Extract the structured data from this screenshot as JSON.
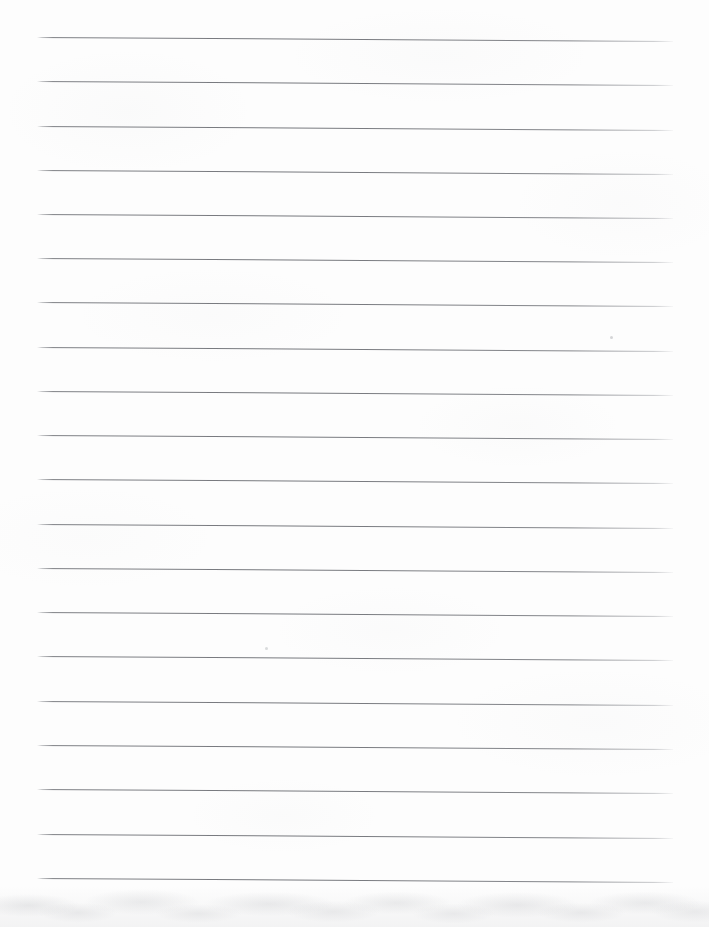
{
  "document": {
    "kind": "lined-notebook-paper",
    "title": "Blank Ruled Paper",
    "width_px": 709,
    "height_px": 927,
    "page_background_color": "#fdfdfd",
    "has_written_content": false,
    "body_text": ""
  },
  "ruling": {
    "line_count": 20,
    "line_color": "#787a7d",
    "line_thickness_px": 1,
    "line_spacing_px": 44.3,
    "first_line_y_px": 37,
    "last_line_y_px": 878,
    "line_start_x_px": 37,
    "line_end_x_px": 673,
    "line_length_px": 636,
    "tilt_deg": 0.35,
    "left_margin_px": 37,
    "right_margin_px": 36,
    "top_margin_px": 37,
    "bottom_margin_px": 49,
    "has_vertical_margin_rule": false,
    "has_holes": false,
    "lines": [
      {
        "index": 1,
        "y_px": 37,
        "content": ""
      },
      {
        "index": 2,
        "y_px": 81,
        "content": ""
      },
      {
        "index": 3,
        "y_px": 126,
        "content": ""
      },
      {
        "index": 4,
        "y_px": 170,
        "content": ""
      },
      {
        "index": 5,
        "y_px": 214,
        "content": ""
      },
      {
        "index": 6,
        "y_px": 258,
        "content": ""
      },
      {
        "index": 7,
        "y_px": 302,
        "content": ""
      },
      {
        "index": 8,
        "y_px": 347,
        "content": ""
      },
      {
        "index": 9,
        "y_px": 391,
        "content": ""
      },
      {
        "index": 10,
        "y_px": 435,
        "content": ""
      },
      {
        "index": 11,
        "y_px": 479,
        "content": ""
      },
      {
        "index": 12,
        "y_px": 524,
        "content": ""
      },
      {
        "index": 13,
        "y_px": 568,
        "content": ""
      },
      {
        "index": 14,
        "y_px": 612,
        "content": ""
      },
      {
        "index": 15,
        "y_px": 656,
        "content": ""
      },
      {
        "index": 16,
        "y_px": 701,
        "content": ""
      },
      {
        "index": 17,
        "y_px": 745,
        "content": ""
      },
      {
        "index": 18,
        "y_px": 789,
        "content": ""
      },
      {
        "index": 19,
        "y_px": 834,
        "content": ""
      },
      {
        "index": 20,
        "y_px": 878,
        "content": ""
      }
    ]
  },
  "marks": [
    {
      "name": "speck-upper-right",
      "x_px": 610,
      "y_px": 336,
      "size_px": 3,
      "color": "#b9bbbe"
    },
    {
      "name": "speck-lower-left",
      "x_px": 265,
      "y_px": 647,
      "size_px": 3,
      "color": "#c2c4c7"
    }
  ],
  "scan_artifacts": {
    "bottom_shadow_band": true,
    "bottom_shadow_height_px": 48,
    "bottom_shadow_color": "#9a9ca0"
  }
}
